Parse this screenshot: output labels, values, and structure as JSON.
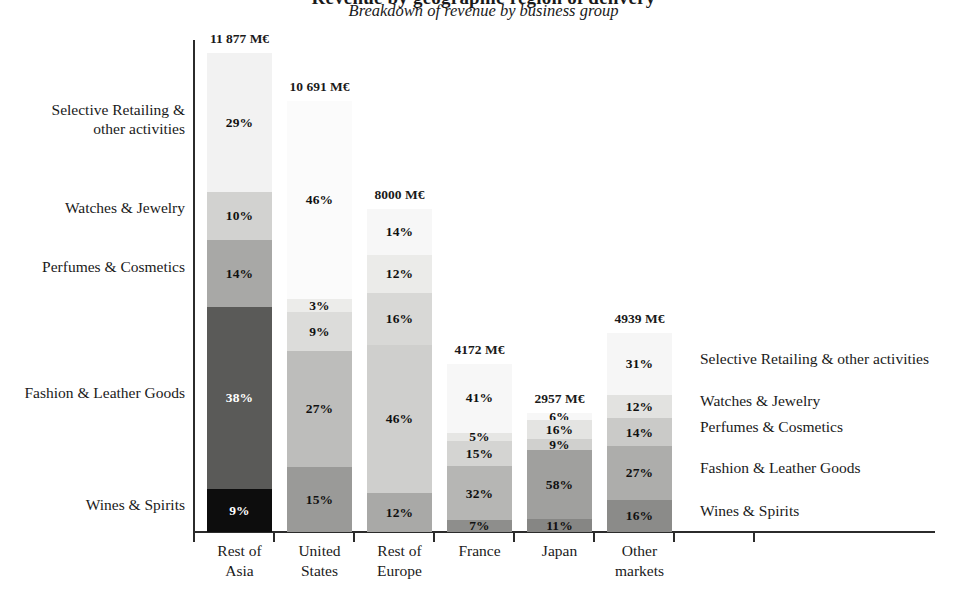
{
  "chart_data": {
    "type": "bar",
    "subtype": "stacked-100-percent",
    "title": "Revenue by geographic region of delivery",
    "subtitle": "Breakdown of revenue by business group",
    "xlabel": "",
    "ylabel": "",
    "grid": false,
    "legend_position": "right-and-left-series-labels",
    "units": "M€",
    "categories": [
      "Rest of\nAsia",
      "United\nStates",
      "Rest of\nEurope",
      "France",
      "Japan",
      "Other\nmarkets"
    ],
    "category_totals": [
      "11 877 M€",
      "10 691 M€",
      "8000 M€",
      "4172 M€",
      "2957 M€",
      "4939 M€"
    ],
    "category_totals_numeric": [
      11877,
      10691,
      8000,
      4172,
      2957,
      4939
    ],
    "series": [
      {
        "name": "Selective Retailing & other activities",
        "color": "#f4f4f4",
        "text_color": "#111111",
        "values": [
          29,
          46,
          14,
          41,
          6,
          31
        ],
        "labels": [
          "29%",
          "46%",
          "14%",
          "41%",
          "6%",
          "31%"
        ]
      },
      {
        "name": "Watches & Jewelry",
        "color": "#dededc",
        "text_color": "#111111",
        "values": [
          10,
          3,
          12,
          5,
          16,
          12
        ],
        "labels": [
          "10%",
          "3%",
          "12%",
          "5%",
          "16%",
          "12%"
        ]
      },
      {
        "name": "Perfumes & Cosmetics",
        "color": "#b9b9b7",
        "text_color": "#111111",
        "values": [
          14,
          9,
          16,
          15,
          9,
          14
        ],
        "labels": [
          "14%",
          "9%",
          "16%",
          "15%",
          "9%",
          "14%"
        ]
      },
      {
        "name": "Fashion & Leather Goods",
        "color": "#8e8e8c",
        "text_color": "#111111",
        "values": [
          38,
          27,
          46,
          32,
          58,
          27
        ],
        "labels": [
          "38%",
          "27%",
          "46%",
          "32%",
          "58%",
          "27%"
        ]
      },
      {
        "name": "Wines & Spirits",
        "color": "#6d6d6b",
        "text_color": "#111111",
        "values": [
          9,
          15,
          12,
          7,
          11,
          16
        ],
        "labels": [
          "9%",
          "15%",
          "12%",
          "7%",
          "11%",
          "16%"
        ]
      }
    ],
    "bar_shade_overrides": {
      "note": "first bar uses darker shades",
      "0": [
        "#f2f2f2",
        "#d2d2d0",
        "#a8a8a6",
        "#5a5a58",
        "#0d0d0d"
      ],
      "1": [
        "#fbfbfb",
        "#ececea",
        "#dcdcda",
        "#bdbdbb",
        "#9a9a98"
      ],
      "2": [
        "#f7f7f7",
        "#ebebe9",
        "#d8d8d6",
        "#cfcfcd",
        "#a9a9a7"
      ],
      "3": [
        "#f7f7f7",
        "#e6e6e4",
        "#d4d4d2",
        "#b6b6b4",
        "#8e8e8c"
      ],
      "4": [
        "#f7f7f7",
        "#e4e4e2",
        "#d0d0ce",
        "#a0a09e",
        "#868684"
      ],
      "5": [
        "#f6f6f6",
        "#e2e2e0",
        "#cacac8",
        "#adadab",
        "#8b8b89"
      ]
    }
  },
  "left_labels": [
    {
      "text": "Selective Retailing &\nother activities",
      "top": 100
    },
    {
      "text": "Watches & Jewelry",
      "top": 198
    },
    {
      "text": "Perfumes & Cosmetics",
      "top": 257
    },
    {
      "text": "Fashion & Leather Goods",
      "top": 383
    },
    {
      "text": "Wines & Spirits",
      "top": 495
    }
  ],
  "right_labels": [
    {
      "text": "Selective Retailing & other activities",
      "top": 349
    },
    {
      "text": "Watches & Jewelry",
      "top": 391
    },
    {
      "text": "Perfumes & Cosmetics",
      "top": 417
    },
    {
      "text": "Fashion & Leather Goods",
      "top": 458
    },
    {
      "text": "Wines & Spirits",
      "top": 501
    }
  ]
}
